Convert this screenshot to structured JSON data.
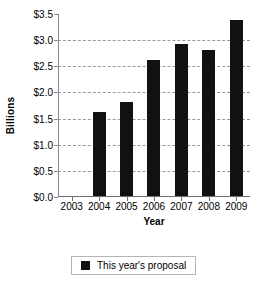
{
  "chart_data": {
    "type": "bar",
    "title": "",
    "xlabel": "Year",
    "ylabel": "Billions",
    "categories": [
      "2003",
      "2004",
      "2005",
      "2006",
      "2007",
      "2008",
      "2009"
    ],
    "values": [
      null,
      1.6,
      1.8,
      2.6,
      2.9,
      2.8,
      3.37
    ],
    "series": [
      {
        "name": "This year's proposal",
        "values": [
          null,
          1.6,
          1.8,
          2.6,
          2.9,
          2.8,
          3.37
        ]
      }
    ],
    "ylim": [
      0.0,
      3.5
    ],
    "ytick_values": [
      0.0,
      0.5,
      1.0,
      1.5,
      2.0,
      2.5,
      3.0,
      3.5
    ],
    "ytick_labels": [
      "$0.0",
      "$0.5",
      "$1.0",
      "$1.5",
      "$2.0",
      "$2.5",
      "$3.0",
      "$3.5"
    ],
    "grid": true,
    "grid_style": "dashed-horizontal",
    "legend_position": "bottom-center",
    "legend": [
      "This year's proposal"
    ],
    "bar_color": "#111111"
  },
  "legend": {
    "label": "This year's proposal",
    "swatch_name": "legend-swatch-black"
  },
  "axes": {
    "y_title": "Billions",
    "x_title": "Year"
  }
}
